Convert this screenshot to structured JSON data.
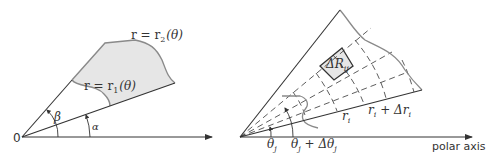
{
  "left_figure": {
    "origin_label": "0",
    "alpha_label": "α",
    "beta_label": "β",
    "inner_curve_label": {
      "lhs": "r = r",
      "sub": "1",
      "rhs": "(θ)"
    },
    "outer_curve_label": {
      "lhs": "r = r",
      "sub": "2",
      "rhs": "(θ)"
    },
    "region_fill": "#e6e6e6",
    "curve_color": "#8a8a8a"
  },
  "right_figure": {
    "cell_label": {
      "main": "ΔR",
      "sub": "ij"
    },
    "r_i_label": {
      "main": "r",
      "sub": "i"
    },
    "r_i_plus_label": {
      "main": "r",
      "sub": "i",
      "rest": " + Δr",
      "sub2": "i"
    },
    "theta_j_label": {
      "main": "θ",
      "sub": "j"
    },
    "theta_j_plus_label": {
      "main": "θ",
      "sub": "j",
      "rest": " + Δθ",
      "sub2": "j"
    },
    "axis_label": "polar axis",
    "cell_fill": "#e6e6e6"
  },
  "colors": {
    "line": "#333333",
    "gray_curve": "#8a8a8a",
    "fill": "#e6e6e6"
  }
}
